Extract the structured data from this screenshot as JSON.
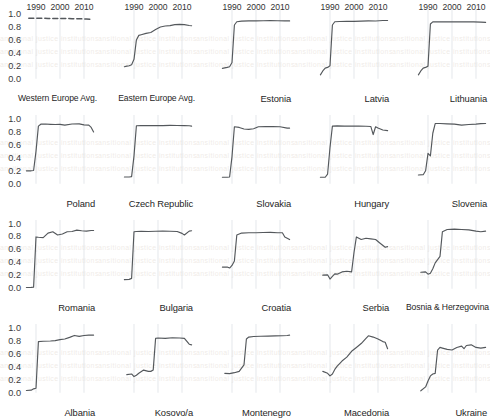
{
  "figure": {
    "type": "small-multiples-line-grid",
    "rows": 4,
    "cols": 5,
    "y_ticks": [
      "1.0",
      "0.8",
      "0.6",
      "0.4",
      "0.2",
      "0.0"
    ],
    "x_ticks": [
      "1990",
      "2000",
      "2010"
    ],
    "ylim": [
      0.0,
      1.0
    ],
    "xlim": [
      1985,
      2015
    ],
    "line_color": "#54585c",
    "grid_color": "#d8dde3"
  },
  "chart_data": {
    "type": "line",
    "title": "",
    "xlabel": "",
    "ylabel": "",
    "xlim": [
      1985,
      2015
    ],
    "ylim": [
      0.0,
      1.0
    ],
    "x_tick_values": [
      1990,
      2000,
      2010
    ],
    "y_tick_values": [
      0.0,
      0.2,
      0.4,
      0.6,
      0.8,
      1.0
    ],
    "grid": true,
    "legend": "none",
    "panels": [
      {
        "name": "Western Europe Avg.",
        "row": 1,
        "col": 1,
        "style": "dashed",
        "x": [
          1987,
          1989,
          1991,
          1993,
          1995,
          1997,
          1999,
          2001,
          2003,
          2005,
          2007,
          2009,
          2011,
          2013
        ],
        "y": [
          0.935,
          0.935,
          0.934,
          0.933,
          0.932,
          0.932,
          0.931,
          0.93,
          0.929,
          0.928,
          0.927,
          0.925,
          0.922,
          0.918
        ]
      },
      {
        "name": "Eastern Europe Avg.",
        "row": 1,
        "col": 2,
        "style": "solid",
        "x": [
          1986,
          1987,
          1988,
          1989,
          1990,
          1991,
          1992,
          1993,
          1995,
          1997,
          1999,
          2001,
          2003,
          2005,
          2007,
          2009,
          2011,
          2013,
          2014
        ],
        "y": [
          0.185,
          0.195,
          0.2,
          0.215,
          0.3,
          0.6,
          0.67,
          0.68,
          0.7,
          0.715,
          0.76,
          0.8,
          0.815,
          0.82,
          0.835,
          0.84,
          0.835,
          0.822,
          0.818
        ]
      },
      {
        "name": "Estonia",
        "row": 1,
        "col": 3,
        "style": "solid",
        "x": [
          1986,
          1988,
          1989,
          1990,
          1991,
          1992,
          1994,
          1997,
          2000,
          2003,
          2006,
          2009,
          2012,
          2014
        ],
        "y": [
          0.16,
          0.175,
          0.185,
          0.25,
          0.83,
          0.88,
          0.89,
          0.893,
          0.893,
          0.895,
          0.897,
          0.896,
          0.894,
          0.893
        ]
      },
      {
        "name": "Latvia",
        "row": 1,
        "col": 4,
        "style": "solid",
        "x": [
          1986,
          1987,
          1988,
          1989,
          1990,
          1991,
          1992,
          1994,
          1997,
          2000,
          2003,
          2006,
          2009,
          2012,
          2014
        ],
        "y": [
          0.06,
          0.12,
          0.165,
          0.175,
          0.2,
          0.83,
          0.88,
          0.884,
          0.886,
          0.886,
          0.89,
          0.894,
          0.892,
          0.9,
          0.9
        ]
      },
      {
        "name": "Lithuania",
        "row": 1,
        "col": 5,
        "style": "solid",
        "x": [
          1986,
          1987,
          1988,
          1989,
          1990,
          1991,
          1992,
          1994,
          1997,
          2000,
          2003,
          2006,
          2009,
          2012,
          2014
        ],
        "y": [
          0.06,
          0.12,
          0.165,
          0.175,
          0.195,
          0.845,
          0.878,
          0.88,
          0.878,
          0.88,
          0.878,
          0.88,
          0.878,
          0.875,
          0.87
        ]
      },
      {
        "name": "Poland",
        "row": 2,
        "col": 1,
        "style": "solid",
        "x": [
          1986,
          1988,
          1989,
          1990,
          1991,
          1992,
          1994,
          1996,
          1998,
          2000,
          2002,
          2005,
          2008,
          2010,
          2012,
          2013,
          2014
        ],
        "y": [
          0.2,
          0.2,
          0.205,
          0.5,
          0.89,
          0.92,
          0.922,
          0.918,
          0.915,
          0.918,
          0.905,
          0.922,
          0.925,
          0.91,
          0.905,
          0.87,
          0.8
        ]
      },
      {
        "name": "Czech Republic",
        "row": 2,
        "col": 2,
        "style": "solid",
        "x": [
          1986,
          1988,
          1989,
          1990,
          1991,
          1993,
          1996,
          1999,
          2002,
          2005,
          2008,
          2011,
          2013,
          2014
        ],
        "y": [
          0.105,
          0.105,
          0.11,
          0.43,
          0.895,
          0.898,
          0.898,
          0.9,
          0.898,
          0.902,
          0.9,
          0.898,
          0.895,
          0.89
        ]
      },
      {
        "name": "Slovakia",
        "row": 2,
        "col": 3,
        "style": "solid",
        "x": [
          1986,
          1988,
          1989,
          1990,
          1991,
          1993,
          1995,
          1997,
          1999,
          2001,
          2004,
          2007,
          2010,
          2013,
          2014
        ],
        "y": [
          0.1,
          0.1,
          0.105,
          0.42,
          0.88,
          0.87,
          0.845,
          0.84,
          0.85,
          0.88,
          0.885,
          0.882,
          0.88,
          0.86,
          0.86
        ]
      },
      {
        "name": "Hungary",
        "row": 2,
        "col": 4,
        "style": "solid",
        "x": [
          1986,
          1988,
          1989,
          1990,
          1991,
          1993,
          1996,
          1999,
          2002,
          2005,
          2007,
          2008,
          2009,
          2010,
          2012,
          2014
        ],
        "y": [
          0.1,
          0.1,
          0.15,
          0.56,
          0.89,
          0.893,
          0.89,
          0.892,
          0.89,
          0.888,
          0.885,
          0.76,
          0.88,
          0.86,
          0.83,
          0.82
        ]
      },
      {
        "name": "Slovenia",
        "row": 2,
        "col": 5,
        "style": "solid",
        "x": [
          1986,
          1988,
          1989,
          1990,
          1991,
          1992,
          1993,
          1995,
          1998,
          2001,
          2004,
          2007,
          2010,
          2012,
          2014
        ],
        "y": [
          0.135,
          0.14,
          0.2,
          0.47,
          0.43,
          0.78,
          0.93,
          0.93,
          0.925,
          0.92,
          0.905,
          0.915,
          0.92,
          0.928,
          0.93
        ]
      },
      {
        "name": "Romania",
        "row": 3,
        "col": 1,
        "style": "solid",
        "x": [
          1986,
          1988,
          1989,
          1990,
          1991,
          1993,
          1995,
          1997,
          1999,
          2001,
          2003,
          2005,
          2007,
          2009,
          2011,
          2013,
          2014
        ],
        "y": [
          0.02,
          0.022,
          0.025,
          0.8,
          0.795,
          0.79,
          0.86,
          0.88,
          0.83,
          0.845,
          0.88,
          0.885,
          0.905,
          0.895,
          0.89,
          0.9,
          0.9
        ]
      },
      {
        "name": "Bulgaria",
        "row": 3,
        "col": 2,
        "style": "solid",
        "x": [
          1986,
          1988,
          1989,
          1990,
          1991,
          1993,
          1996,
          1999,
          2002,
          2005,
          2008,
          2010,
          2011,
          2013,
          2014
        ],
        "y": [
          0.14,
          0.145,
          0.16,
          0.88,
          0.885,
          0.888,
          0.885,
          0.888,
          0.89,
          0.888,
          0.885,
          0.855,
          0.83,
          0.89,
          0.895
        ]
      },
      {
        "name": "Croatia",
        "row": 3,
        "col": 3,
        "style": "solid",
        "x": [
          1986,
          1988,
          1989,
          1990,
          1991,
          1992,
          1994,
          1997,
          2000,
          2003,
          2006,
          2009,
          2011,
          2012,
          2014
        ],
        "y": [
          0.335,
          0.335,
          0.32,
          0.36,
          0.43,
          0.83,
          0.86,
          0.865,
          0.865,
          0.868,
          0.87,
          0.865,
          0.865,
          0.8,
          0.76
        ]
      },
      {
        "name": "Serbia",
        "row": 3,
        "col": 4,
        "style": "solid",
        "x": [
          1987,
          1989,
          1990,
          1991,
          1992,
          1993,
          1995,
          1997,
          1999,
          2000,
          2001,
          2003,
          2005,
          2007,
          2009,
          2011,
          2013,
          2014
        ],
        "y": [
          0.21,
          0.215,
          0.15,
          0.19,
          0.23,
          0.225,
          0.26,
          0.27,
          0.26,
          0.56,
          0.8,
          0.76,
          0.78,
          0.77,
          0.76,
          0.7,
          0.64,
          0.65
        ]
      },
      {
        "name": "Bosnia & Herzegovina",
        "row": 3,
        "col": 5,
        "style": "solid",
        "x": [
          1987,
          1989,
          1990,
          1991,
          1992,
          1993,
          1995,
          1996,
          1998,
          2001,
          2004,
          2007,
          2010,
          2012,
          2014
        ],
        "y": [
          0.255,
          0.26,
          0.225,
          0.24,
          0.31,
          0.4,
          0.5,
          0.88,
          0.915,
          0.92,
          0.915,
          0.91,
          0.89,
          0.88,
          0.89
        ]
      },
      {
        "name": "Albania",
        "row": 4,
        "col": 1,
        "style": "solid",
        "x": [
          1986,
          1988,
          1989,
          1990,
          1991,
          1993,
          1996,
          1998,
          2000,
          2002,
          2004,
          2006,
          2008,
          2010,
          2012,
          2014
        ],
        "y": [
          0.035,
          0.04,
          0.06,
          0.07,
          0.79,
          0.795,
          0.8,
          0.805,
          0.82,
          0.83,
          0.855,
          0.885,
          0.87,
          0.885,
          0.89,
          0.89
        ]
      },
      {
        "name": "Kosovo/a",
        "row": 4,
        "col": 2,
        "style": "solid",
        "x": [
          1987,
          1989,
          1990,
          1991,
          1992,
          1994,
          1996,
          1997,
          1998,
          1999,
          2000,
          2003,
          2006,
          2009,
          2011,
          2013,
          2014
        ],
        "y": [
          0.28,
          0.29,
          0.25,
          0.27,
          0.3,
          0.35,
          0.33,
          0.33,
          0.35,
          0.84,
          0.845,
          0.84,
          0.85,
          0.845,
          0.84,
          0.75,
          0.74
        ]
      },
      {
        "name": "Montenegro",
        "row": 4,
        "col": 3,
        "style": "solid",
        "x": [
          1987,
          1989,
          1991,
          1993,
          1995,
          1996,
          1997,
          1999,
          2002,
          2005,
          2008,
          2011,
          2013,
          2014
        ],
        "y": [
          0.3,
          0.295,
          0.31,
          0.33,
          0.43,
          0.83,
          0.86,
          0.868,
          0.872,
          0.875,
          0.878,
          0.88,
          0.885,
          0.89
        ]
      },
      {
        "name": "Macedonia",
        "row": 4,
        "col": 4,
        "style": "solid",
        "x": [
          1987,
          1989,
          1990,
          1991,
          1992,
          1993,
          1995,
          1997,
          1999,
          2001,
          2003,
          2005,
          2006,
          2008,
          2010,
          2012,
          2013,
          2014
        ],
        "y": [
          0.33,
          0.3,
          0.26,
          0.29,
          0.36,
          0.41,
          0.49,
          0.55,
          0.64,
          0.7,
          0.76,
          0.84,
          0.88,
          0.86,
          0.83,
          0.79,
          0.78,
          0.68
        ]
      },
      {
        "name": "Ukraine",
        "row": 4,
        "col": 5,
        "style": "solid",
        "x": [
          1987,
          1989,
          1990,
          1991,
          1992,
          1993,
          1994,
          1995,
          1996,
          1998,
          2000,
          2002,
          2004,
          2005,
          2006,
          2008,
          2010,
          2012,
          2014
        ],
        "y": [
          0.03,
          0.09,
          0.18,
          0.26,
          0.29,
          0.3,
          0.66,
          0.7,
          0.69,
          0.67,
          0.66,
          0.7,
          0.72,
          0.68,
          0.73,
          0.74,
          0.7,
          0.69,
          0.7
        ]
      }
    ]
  }
}
